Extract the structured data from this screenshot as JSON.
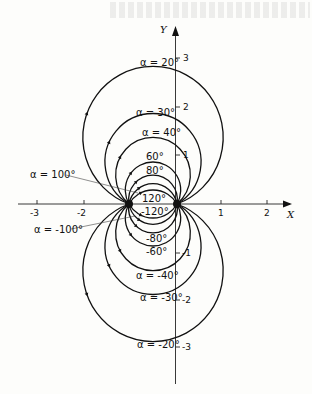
{
  "figure": {
    "x_axis_label": "X",
    "y_axis_label": "Y",
    "x_ticks": [
      {
        "value": -3,
        "label": "-3"
      },
      {
        "value": -2,
        "label": "-2"
      },
      {
        "value": 1,
        "label": "1"
      },
      {
        "value": 2,
        "label": "2"
      }
    ],
    "y_ticks": [
      {
        "value": 3,
        "label": "3"
      },
      {
        "value": 2,
        "label": "2"
      },
      {
        "value": 1,
        "label": "1"
      },
      {
        "value": -1,
        "label": "-1"
      },
      {
        "value": -2,
        "label": "-2"
      },
      {
        "value": -3,
        "label": "-3"
      }
    ],
    "focal_points": [
      [
        -1,
        0
      ],
      [
        0,
        0
      ]
    ],
    "curve_labels": {
      "p20": "α = 20°",
      "p30": "α = 30°",
      "p40": "α = 40°",
      "p60": "60°",
      "p80": "80°",
      "p100": "α = 100°",
      "p120": "120°",
      "n120": "-120°",
      "n100": "α = -100°",
      "n80": "-80°",
      "n60": "-60°",
      "n40": "α = -40°",
      "n30": "α = -30°",
      "n20": "α = -20°"
    },
    "angles_deg": [
      20,
      30,
      40,
      60,
      80,
      100,
      120,
      -120,
      -100,
      -80,
      -60,
      -40,
      -30,
      -20
    ],
    "line_color": "#111111",
    "background": "#fdfdfb"
  }
}
